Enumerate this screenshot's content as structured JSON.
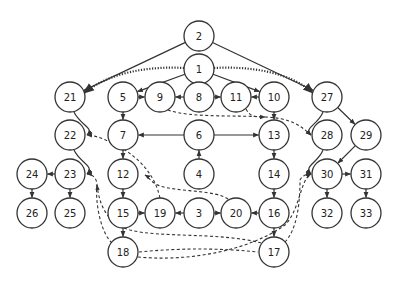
{
  "diagram": {
    "type": "directed-graph",
    "node_radius": 15,
    "colors": {
      "stroke": "#333333",
      "fill": "#ffffff",
      "text": "#222222",
      "background": "#ffffff"
    },
    "nodes": [
      {
        "id": "2",
        "label": "2",
        "x": 199,
        "y": 36
      },
      {
        "id": "1",
        "label": "1",
        "x": 199,
        "y": 69
      },
      {
        "id": "21",
        "label": "21",
        "x": 70,
        "y": 97
      },
      {
        "id": "5",
        "label": "5",
        "x": 123,
        "y": 97
      },
      {
        "id": "9",
        "label": "9",
        "x": 160,
        "y": 97
      },
      {
        "id": "8",
        "label": "8",
        "x": 199,
        "y": 97
      },
      {
        "id": "11",
        "label": "11",
        "x": 236,
        "y": 97
      },
      {
        "id": "10",
        "label": "10",
        "x": 274,
        "y": 97
      },
      {
        "id": "27",
        "label": "27",
        "x": 327,
        "y": 97
      },
      {
        "id": "22",
        "label": "22",
        "x": 70,
        "y": 135
      },
      {
        "id": "7",
        "label": "7",
        "x": 123,
        "y": 135
      },
      {
        "id": "6",
        "label": "6",
        "x": 199,
        "y": 135
      },
      {
        "id": "13",
        "label": "13",
        "x": 274,
        "y": 135
      },
      {
        "id": "28",
        "label": "28",
        "x": 327,
        "y": 135
      },
      {
        "id": "29",
        "label": "29",
        "x": 366,
        "y": 135
      },
      {
        "id": "24",
        "label": "24",
        "x": 32,
        "y": 174
      },
      {
        "id": "23",
        "label": "23",
        "x": 70,
        "y": 174
      },
      {
        "id": "12",
        "label": "12",
        "x": 123,
        "y": 174
      },
      {
        "id": "4",
        "label": "4",
        "x": 199,
        "y": 174
      },
      {
        "id": "14",
        "label": "14",
        "x": 274,
        "y": 174
      },
      {
        "id": "30",
        "label": "30",
        "x": 327,
        "y": 174
      },
      {
        "id": "31",
        "label": "31",
        "x": 366,
        "y": 174
      },
      {
        "id": "26",
        "label": "26",
        "x": 32,
        "y": 213
      },
      {
        "id": "25",
        "label": "25",
        "x": 70,
        "y": 213
      },
      {
        "id": "15",
        "label": "15",
        "x": 123,
        "y": 213
      },
      {
        "id": "19",
        "label": "19",
        "x": 160,
        "y": 213
      },
      {
        "id": "3",
        "label": "3",
        "x": 199,
        "y": 213
      },
      {
        "id": "20",
        "label": "20",
        "x": 236,
        "y": 213
      },
      {
        "id": "16",
        "label": "16",
        "x": 274,
        "y": 213
      },
      {
        "id": "32",
        "label": "32",
        "x": 327,
        "y": 213
      },
      {
        "id": "33",
        "label": "33",
        "x": 366,
        "y": 213
      },
      {
        "id": "18",
        "label": "18",
        "x": 123,
        "y": 252
      },
      {
        "id": "17",
        "label": "17",
        "x": 274,
        "y": 252
      }
    ],
    "edges": [
      {
        "from": "2",
        "to": "21",
        "style": "solid"
      },
      {
        "from": "2",
        "to": "27",
        "style": "solid"
      },
      {
        "from": "1",
        "to": "21",
        "style": "dotted",
        "d": "M184,68 C150,66 110,72 84,93"
      },
      {
        "from": "1",
        "to": "27",
        "style": "dotted",
        "d": "M214,68 C250,66 290,72 313,93"
      },
      {
        "from": "1",
        "to": "5",
        "style": "solid"
      },
      {
        "from": "1",
        "to": "10",
        "style": "solid"
      },
      {
        "from": "5",
        "to": "9",
        "style": "solid"
      },
      {
        "from": "8",
        "to": "9",
        "style": "solid"
      },
      {
        "from": "8",
        "to": "11",
        "style": "solid"
      },
      {
        "from": "10",
        "to": "11",
        "style": "solid"
      },
      {
        "from": "5",
        "to": "7",
        "style": "solid"
      },
      {
        "from": "10",
        "to": "13",
        "style": "solid"
      },
      {
        "from": "6",
        "to": "7",
        "style": "solid"
      },
      {
        "from": "6",
        "to": "13",
        "style": "solid"
      },
      {
        "from": "4",
        "to": "6",
        "style": "solid"
      },
      {
        "from": "7",
        "to": "12",
        "style": "solid"
      },
      {
        "from": "12",
        "to": "15",
        "style": "solid"
      },
      {
        "from": "13",
        "to": "14",
        "style": "solid"
      },
      {
        "from": "14",
        "to": "16",
        "style": "solid"
      },
      {
        "from": "15",
        "to": "19",
        "style": "solid"
      },
      {
        "from": "3",
        "to": "19",
        "style": "solid"
      },
      {
        "from": "3",
        "to": "20",
        "style": "solid"
      },
      {
        "from": "16",
        "to": "20",
        "style": "solid"
      },
      {
        "from": "15",
        "to": "18",
        "style": "solid"
      },
      {
        "from": "16",
        "to": "17",
        "style": "solid"
      },
      {
        "from": "23",
        "to": "24",
        "style": "solid"
      },
      {
        "from": "23",
        "to": "25",
        "style": "solid"
      },
      {
        "from": "24",
        "to": "26",
        "style": "solid"
      },
      {
        "from": "27",
        "to": "29",
        "style": "solid"
      },
      {
        "from": "29",
        "to": "30",
        "style": "solid"
      },
      {
        "from": "30",
        "to": "31",
        "style": "solid"
      },
      {
        "from": "30",
        "to": "32",
        "style": "solid"
      },
      {
        "from": "31",
        "to": "33",
        "style": "solid"
      },
      {
        "from": "21",
        "to": "22",
        "style": "solid",
        "d": "M74,112 C80,125 95,128 87,135"
      },
      {
        "from": "22",
        "to": "23",
        "style": "solid",
        "d": "M74,150 C80,163 95,166 87,174"
      },
      {
        "from": "27",
        "to": "28",
        "style": "solid",
        "d": "M323,112 C318,125 303,128 311,135"
      },
      {
        "from": "28",
        "to": "30",
        "style": "solid",
        "d": "M323,150 C318,163 303,166 311,174"
      },
      {
        "from": "9",
        "to": "28",
        "style": "dashed",
        "d": "M168,110 C190,118 240,115 265,117 C290,118 300,125 311,135"
      },
      {
        "from": "11",
        "to": "28",
        "style": "dashed",
        "d": "M246,109 C250,117 255,117 265,117"
      },
      {
        "from": "19",
        "to": "22",
        "style": "dashed",
        "d": "M160,198 C155,175 140,160 125,150 C110,142 100,136 87,135"
      },
      {
        "from": "20",
        "to": "22",
        "style": "dashed",
        "d": "M228,199 C215,190 180,192 160,186 C150,182 150,178 145,175"
      },
      {
        "from": "18",
        "to": "23",
        "style": "dashed",
        "d": "M112,243 C100,232 95,200 97,185 C97,178 92,174 87,174"
      },
      {
        "from": "17",
        "to": "23",
        "style": "dashed",
        "d": "M261,243 C220,232 160,238 130,230 C110,224 100,210 97,185"
      },
      {
        "from": "18",
        "to": "17",
        "style": "dashed",
        "d": "M139,252 C180,248 220,248 258,252"
      },
      {
        "from": "18",
        "to": "30",
        "style": "dashed",
        "d": "M138,257 C190,262 250,250 285,225 C300,210 300,180 311,174"
      },
      {
        "from": "17",
        "to": "30",
        "style": "dashed",
        "d": "M285,242 C298,228 300,200 300,180 C302,176 306,174 311,174"
      }
    ]
  }
}
